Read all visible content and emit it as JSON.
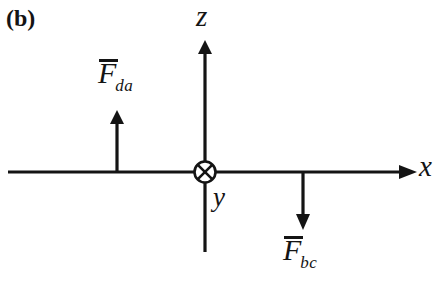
{
  "figure": {
    "panel_label": "(b)",
    "background_color": "#ffffff",
    "ink_color": "#141414"
  },
  "axes": [
    {
      "name": "x-axis",
      "label": "x",
      "direction": "right",
      "arrowhead": true
    },
    {
      "name": "z-axis",
      "label": "z",
      "direction": "up",
      "arrowhead": true
    },
    {
      "name": "y-axis",
      "label": "y",
      "direction": "into-page",
      "symbol": "circle-with-x",
      "arrowhead": false
    }
  ],
  "vectors": [
    {
      "name": "force-da",
      "symbol": "F",
      "overbar": true,
      "subscript": "da",
      "direction": "up"
    },
    {
      "name": "force-bc",
      "symbol": "F",
      "overbar": true,
      "subscript": "bc",
      "direction": "down"
    }
  ],
  "diagram_geometry": {
    "origin": {
      "x": 205,
      "y": 172
    },
    "x_axis": {
      "x_start": 8,
      "x_end": 415,
      "y": 172
    },
    "z_axis": {
      "x": 205,
      "y_top": 42,
      "y_bottom": 252
    },
    "origin_marker_radius": 11,
    "force_da_arrow": {
      "x": 117,
      "y_tail": 172,
      "y_tip": 112
    },
    "force_bc_arrow": {
      "x": 303,
      "y_tail": 172,
      "y_tip": 228
    }
  }
}
